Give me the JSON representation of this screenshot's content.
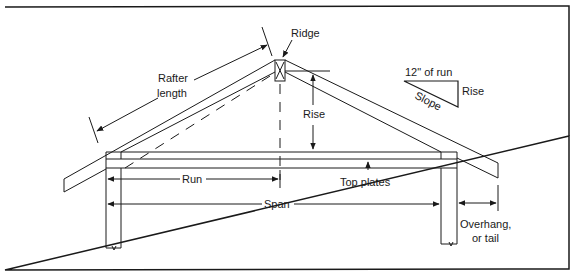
{
  "diagram": {
    "labels": {
      "ridge": "Ridge",
      "rafter_length_line1": "Rafter",
      "rafter_length_line2": "length",
      "rise": "Rise",
      "run": "Run",
      "span": "Span",
      "top_plates": "Top plates",
      "overhang_line1": "Overhang,",
      "overhang_line2": "or tail"
    },
    "slope_legend": {
      "run_label": "12\" of run",
      "rise_label": "Rise",
      "slope_label": "Slope"
    },
    "colors": {
      "line": "#1a1a1a",
      "background": "#ffffff"
    }
  }
}
